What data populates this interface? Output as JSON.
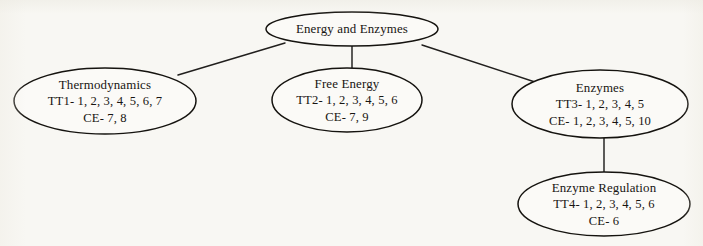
{
  "diagram": {
    "type": "concept-map-tree",
    "title_node": "Energy and Enzymes",
    "nodes": [
      {
        "id": "root",
        "title": "Energy and Enzymes",
        "lines": [
          "Energy and Enzymes"
        ],
        "cx": 352,
        "cy": 29,
        "rx": 86,
        "ry": 17
      },
      {
        "id": "thermodynamics",
        "title": "Thermodynamics",
        "lines": [
          "Thermodynamics",
          "TT1- 1, 2, 3, 4, 5, 6, 7",
          "CE- 7, 8"
        ],
        "cx": 105,
        "cy": 101,
        "rx": 91,
        "ry": 33
      },
      {
        "id": "free-energy",
        "title": "Free Energy",
        "lines": [
          "Free Energy",
          "TT2- 1, 2, 3, 4, 5, 6",
          "CE- 7, 9"
        ],
        "cx": 347,
        "cy": 100,
        "rx": 75,
        "ry": 32
      },
      {
        "id": "enzymes",
        "title": "Enzymes",
        "lines": [
          "Enzymes",
          "TT3- 1, 2, 3, 4, 5",
          "CE- 1, 2, 3, 4, 5, 10"
        ],
        "cx": 600,
        "cy": 104,
        "rx": 88,
        "ry": 34
      },
      {
        "id": "enzyme-regulation",
        "title": "Enzyme Regulation",
        "lines": [
          "Enzyme Regulation",
          "TT4- 1, 2, 3, 4, 5, 6",
          "CE- 6"
        ],
        "cx": 604,
        "cy": 204,
        "rx": 86,
        "ry": 32
      }
    ],
    "edges": [
      {
        "id": "root-to-thermodynamics",
        "from": "root",
        "to": "thermodynamics",
        "x1": 285,
        "y1": 43,
        "x2": 178,
        "y2": 75
      },
      {
        "id": "root-to-free-energy",
        "from": "root",
        "to": "free-energy",
        "x1": 352,
        "y1": 46,
        "x2": 352,
        "y2": 69
      },
      {
        "id": "root-to-enzymes",
        "from": "root",
        "to": "enzymes",
        "x1": 422,
        "y1": 45,
        "x2": 538,
        "y2": 83
      },
      {
        "id": "enzymes-to-enzyme-regulation",
        "from": "enzymes",
        "to": "enzyme-regulation",
        "x1": 604,
        "y1": 138,
        "x2": 604,
        "y2": 172
      }
    ],
    "colors": {
      "background": "#f8f7f3",
      "node_fill": "#fbfaf7",
      "stroke": "#15130f",
      "text": "#181512"
    }
  }
}
